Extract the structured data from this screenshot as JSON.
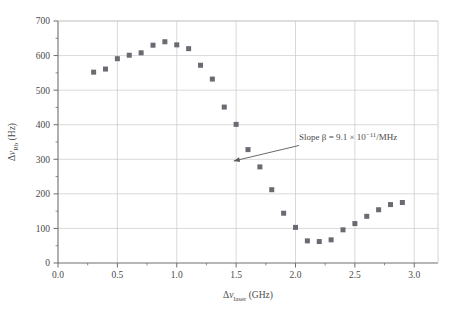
{
  "chart_data": {
    "type": "scatter",
    "title": "",
    "xlabel": "Δν_laser (GHz)",
    "ylabel": "Δν_Rb (Hz)",
    "xlabel_parts": {
      "delta": "Δ",
      "nu": "ν",
      "sub": "laser",
      "unit": " (GHz)"
    },
    "ylabel_parts": {
      "delta": "Δ",
      "nu": "ν",
      "sub": "Rb",
      "unit": " (Hz)"
    },
    "xlim": [
      0.0,
      3.2
    ],
    "ylim": [
      0,
      700
    ],
    "xticks": [
      "0.0",
      "0.5",
      "1.0",
      "1.5",
      "2.0",
      "2.5",
      "3.0"
    ],
    "xtick_values": [
      0.0,
      0.5,
      1.0,
      1.5,
      2.0,
      2.5,
      3.0
    ],
    "yticks": [
      "0",
      "100",
      "200",
      "300",
      "400",
      "500",
      "600",
      "700"
    ],
    "ytick_values": [
      0,
      100,
      200,
      300,
      400,
      500,
      600,
      700
    ],
    "minor_xtick_values": [
      0.25,
      0.75,
      1.25,
      1.75,
      2.25,
      2.75
    ],
    "minor_ytick_values": [
      50,
      150,
      250,
      350,
      450,
      550,
      650
    ],
    "grid": true,
    "grid_color": "#c9c9c9",
    "axis_color": "#6e6e6e",
    "marker": "square",
    "marker_color": "#6a6a72",
    "marker_size": 5,
    "legend": null,
    "x": [
      0.3,
      0.4,
      0.5,
      0.6,
      0.7,
      0.8,
      0.9,
      1.0,
      1.1,
      1.2,
      1.3,
      1.4,
      1.5,
      1.6,
      1.7,
      1.8,
      1.9,
      2.0,
      2.1,
      2.2,
      2.3,
      2.4,
      2.5,
      2.6,
      2.7,
      2.8,
      2.9
    ],
    "y": [
      552,
      561,
      591,
      601,
      608,
      630,
      640,
      631,
      620,
      572,
      532,
      451,
      401,
      328,
      278,
      212,
      144,
      103,
      64,
      62,
      67,
      96,
      114,
      135,
      154,
      169,
      175
    ],
    "annotations": [
      {
        "name": "slope-annotation",
        "text": "Slope β = 9.1 × 10⁻¹¹/MHz",
        "text_parts": {
          "lead": "Slope β = 9.1 × 10",
          "exponent": "−11",
          "trail": "/MHz"
        },
        "text_x": 2.03,
        "text_y": 355,
        "arrow_from_x": 2.03,
        "arrow_from_y": 340,
        "arrow_to_x": 1.48,
        "arrow_to_y": 295
      }
    ]
  }
}
